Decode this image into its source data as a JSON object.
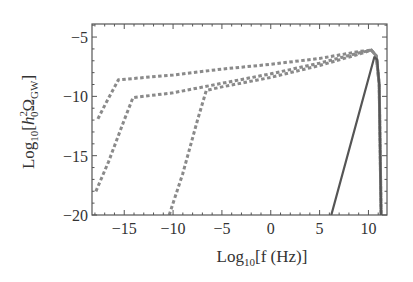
{
  "chart_data": {
    "type": "line",
    "title": "",
    "xlabel": "Log10[f (Hz)]",
    "xlabel_parts": {
      "base": "Log",
      "sub": "10",
      "rest": "[f (Hz)]"
    },
    "ylabel": "Log10[h0^2 Ω_GW]",
    "ylabel_parts": {
      "base": "Log",
      "sub": "10",
      "open": "[",
      "h": "h",
      "h_sup": "2",
      "h_sub": "0",
      "omega": "Ω",
      "omega_sub": "GW",
      "close": "]"
    },
    "xlim": [
      -18.3,
      11.9
    ],
    "ylim": [
      -20,
      -3.9
    ],
    "xticks": [
      -15,
      -10,
      -5,
      0,
      5,
      10
    ],
    "xtick_labels": [
      "−15",
      "−10",
      "−5",
      "0",
      "5",
      "10"
    ],
    "yticks": [
      -5,
      -10,
      -15,
      -20
    ],
    "ytick_labels": [
      "−5",
      "−10",
      "−15",
      "−20"
    ],
    "grid": false,
    "legend": null,
    "series": [
      {
        "name": "dotted-1",
        "style": "dotted",
        "color": "#8a8a8a",
        "points": [
          [
            -17.7,
            -11.9
          ],
          [
            -16.9,
            -10.6
          ],
          [
            -15.6,
            -8.6
          ],
          [
            -10,
            -8.2
          ],
          [
            -5,
            -7.7
          ],
          [
            0,
            -7.3
          ],
          [
            5,
            -6.8
          ],
          [
            9.2,
            -6.2
          ],
          [
            10.3,
            -6.1
          ],
          [
            10.8,
            -6.6
          ],
          [
            11.1,
            -9
          ],
          [
            11.3,
            -20
          ]
        ]
      },
      {
        "name": "dotted-2",
        "style": "dotted",
        "color": "#8a8a8a",
        "points": [
          [
            -17.9,
            -18.0
          ],
          [
            -16.6,
            -15.5
          ],
          [
            -15.0,
            -12.0
          ],
          [
            -14.1,
            -10.1
          ],
          [
            -10,
            -9.7
          ],
          [
            -5,
            -8.9
          ],
          [
            0,
            -8.1
          ],
          [
            5,
            -7.2
          ],
          [
            9.2,
            -6.3
          ],
          [
            10.3,
            -6.1
          ],
          [
            10.8,
            -6.6
          ],
          [
            11.1,
            -9
          ],
          [
            11.3,
            -20
          ]
        ]
      },
      {
        "name": "dotted-3",
        "style": "dotted",
        "color": "#8a8a8a",
        "points": [
          [
            -10.4,
            -20.0
          ],
          [
            -9.0,
            -16.5
          ],
          [
            -7.5,
            -12.0
          ],
          [
            -6.6,
            -9.5
          ],
          [
            -5,
            -9.2
          ],
          [
            0,
            -8.4
          ],
          [
            5,
            -7.4
          ],
          [
            9.2,
            -6.4
          ],
          [
            10.3,
            -6.1
          ],
          [
            10.8,
            -6.6
          ],
          [
            11.1,
            -9
          ],
          [
            11.3,
            -20
          ]
        ]
      },
      {
        "name": "solid",
        "style": "solid",
        "color": "#555555",
        "points": [
          [
            6.2,
            -20.0
          ],
          [
            10.6,
            -6.7
          ],
          [
            10.9,
            -6.9
          ],
          [
            11.1,
            -9
          ],
          [
            11.3,
            -20
          ]
        ]
      }
    ]
  },
  "axes": {
    "frame_color": "#555555",
    "plot_area": {
      "left": 92,
      "top": 24,
      "right": 387,
      "bottom": 215
    }
  }
}
